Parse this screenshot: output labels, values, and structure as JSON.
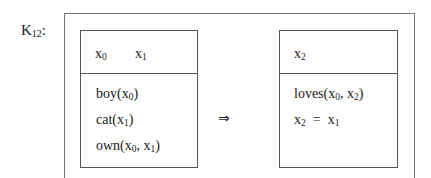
{
  "drs_label": {
    "name": "K",
    "subscript": "12",
    "suffix": ":"
  },
  "antecedent": {
    "universe": [
      {
        "name": "x",
        "sub": "0"
      },
      {
        "name": "x",
        "sub": "1"
      }
    ],
    "conditions": [
      {
        "pred": "boy(",
        "args": [
          {
            "name": "x",
            "sub": "0"
          }
        ],
        "close": ")"
      },
      {
        "pred": "cat(",
        "args": [
          {
            "name": "x",
            "sub": "1"
          }
        ],
        "close": ")"
      },
      {
        "pred": "own(",
        "args": [
          {
            "name": "x",
            "sub": "0"
          },
          {
            "name": "x",
            "sub": "1"
          }
        ],
        "close": ")"
      }
    ]
  },
  "implication_symbol": "⇒",
  "consequent": {
    "universe": [
      {
        "name": "x",
        "sub": "2"
      }
    ],
    "conditions": [
      {
        "pred": "loves(",
        "args": [
          {
            "name": "x",
            "sub": "0"
          },
          {
            "name": "x",
            "sub": "2"
          }
        ],
        "close": ")"
      },
      {
        "lhs": {
          "name": "x",
          "sub": "2"
        },
        "op": "=",
        "rhs": {
          "name": "x",
          "sub": "1"
        }
      }
    ]
  }
}
